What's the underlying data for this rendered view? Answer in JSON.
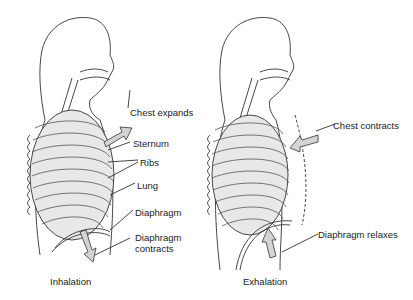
{
  "panels": [
    {
      "title": "Inhalation",
      "labels": {
        "chest": "Chest expands",
        "sternum": "Sternum",
        "ribs": "Ribs",
        "lung": "Lung",
        "diaphragm": "Diaphragm",
        "diaphragm_action_1": "Diaphragm",
        "diaphragm_action_2": "contracts"
      }
    },
    {
      "title": "Exhalation",
      "labels": {
        "chest": "Chest contracts",
        "diaphragm_action": "Diaphragm relaxes"
      }
    }
  ],
  "colors": {
    "line": "#333333",
    "fill": "#e6e6e6",
    "arrow": "#d4d4d4"
  }
}
